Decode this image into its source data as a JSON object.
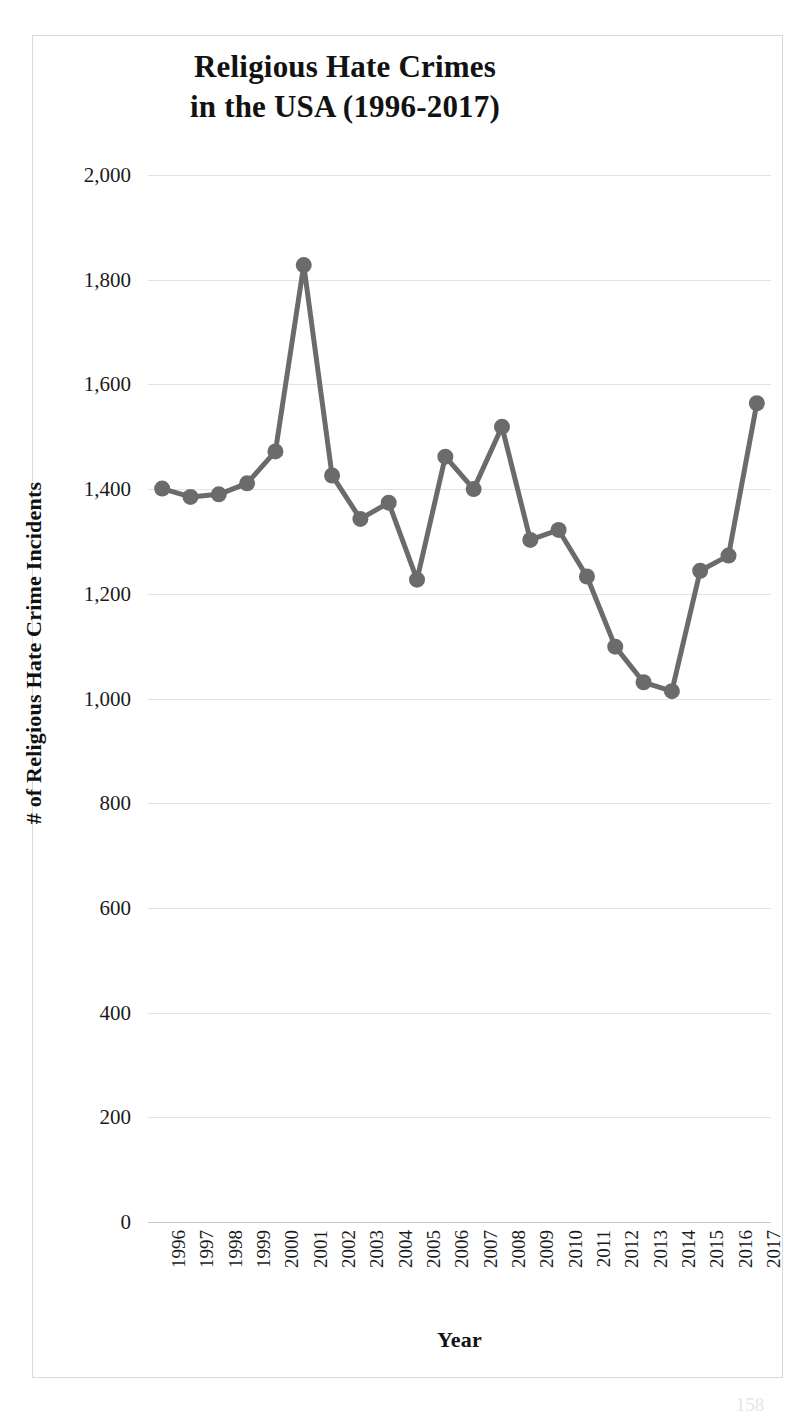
{
  "figure": {
    "border_color": "#d9d9d9",
    "background": "#ffffff",
    "page_number": "158"
  },
  "chart_data": {
    "type": "line",
    "title": "Religious Hate Crimes in the USA (1996-2017)",
    "title_lines": [
      "Religious Hate Crimes",
      "in the USA (1996-2017)"
    ],
    "xlabel": "Year",
    "ylabel": "# of Religious Hate Crime Incidents",
    "series_color": "#6b6b6b",
    "marker": "circle",
    "grid": true,
    "legend": "none",
    "ylim": [
      0,
      2000
    ],
    "ytick_values": [
      0,
      200,
      400,
      600,
      800,
      1000,
      1200,
      1400,
      1600,
      1800,
      2000
    ],
    "ytick_labels": [
      "0",
      "200",
      "400",
      "600",
      "800",
      "1,000",
      "1,200",
      "1,400",
      "1,600",
      "1,800",
      "2,000"
    ],
    "categories": [
      "1996",
      "1997",
      "1998",
      "1999",
      "2000",
      "2001",
      "2002",
      "2003",
      "2004",
      "2005",
      "2006",
      "2007",
      "2008",
      "2009",
      "2010",
      "2011",
      "2012",
      "2013",
      "2014",
      "2015",
      "2016",
      "2017"
    ],
    "values": [
      1401,
      1385,
      1390,
      1411,
      1472,
      1828,
      1426,
      1343,
      1374,
      1227,
      1462,
      1400,
      1519,
      1303,
      1322,
      1233,
      1099,
      1031,
      1014,
      1244,
      1273,
      1564
    ]
  }
}
